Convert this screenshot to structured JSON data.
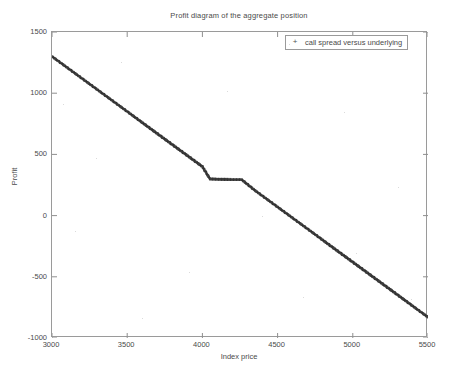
{
  "chart_data": {
    "type": "line",
    "title": "Profit diagram of the aggregate position",
    "xlabel": "Index price",
    "ylabel": "Profit",
    "xlim": [
      3000,
      5500
    ],
    "ylim": [
      -1000,
      1500
    ],
    "xticks": [
      3000,
      3500,
      4000,
      4500,
      5000,
      5500
    ],
    "yticks": [
      1500,
      1000,
      500,
      0,
      -500,
      -1000
    ],
    "grid": false,
    "legend_position": "upper right",
    "marker": "+",
    "series": [
      {
        "name": "call spread versus underlying",
        "color": "#3c3c3c",
        "x": [
          3000,
          3100,
          3200,
          3300,
          3400,
          3500,
          3600,
          3700,
          3800,
          3900,
          4000,
          4050,
          4100,
          4150,
          4200,
          4250,
          4260,
          4350,
          4450,
          4550,
          4650,
          4750,
          4850,
          4950,
          5050,
          5150,
          5250,
          5350,
          5450,
          5500
        ],
        "y": [
          1300,
          1210,
          1120,
          1030,
          940,
          850,
          760,
          670,
          580,
          490,
          400,
          300,
          297,
          296,
          295,
          295,
          295,
          205,
          115,
          25,
          -65,
          -155,
          -245,
          -335,
          -425,
          -515,
          -605,
          -695,
          -785,
          -830
        ]
      }
    ],
    "legend_entries": [
      {
        "marker": "+",
        "label": "call spread versus underlying"
      }
    ],
    "annotations": []
  },
  "figure": {
    "background_color": "#ffffff",
    "axis_color": "#9a9a9a",
    "text_color": "#4a4a4a"
  }
}
